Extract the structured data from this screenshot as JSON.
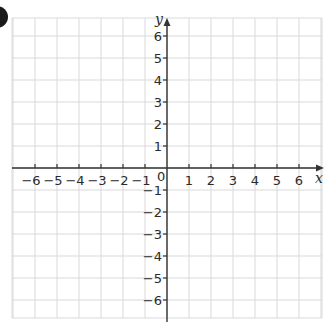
{
  "question_marker": {
    "shape": "partial-circle-badge",
    "color": "#1a1a1a"
  },
  "chart_data": {
    "type": "coordinate-grid",
    "title": "",
    "xlabel": "x",
    "ylabel": "y",
    "xlim": [
      -7,
      7
    ],
    "ylim": [
      -7,
      6.5
    ],
    "grid": true,
    "x_ticks": [
      -6,
      -5,
      -4,
      -3,
      -2,
      -1,
      1,
      2,
      3,
      4,
      5,
      6
    ],
    "y_ticks": [
      6,
      5,
      4,
      3,
      2,
      1,
      -1,
      -2,
      -3,
      -4,
      -5,
      -6
    ],
    "x_tick_labels": [
      "−6",
      "−5",
      "−4",
      "−3",
      "−2",
      "−1",
      "1",
      "2",
      "3",
      "4",
      "5",
      "6"
    ],
    "y_tick_labels": [
      "6",
      "5",
      "4",
      "3",
      "2",
      "1",
      "−1",
      "−2",
      "−3",
      "−4",
      "−5",
      "−6"
    ],
    "origin_label": "0",
    "points": []
  },
  "colors": {
    "grid": "#d9d9d9",
    "axis": "#333333",
    "text": "#2a2a2a"
  }
}
